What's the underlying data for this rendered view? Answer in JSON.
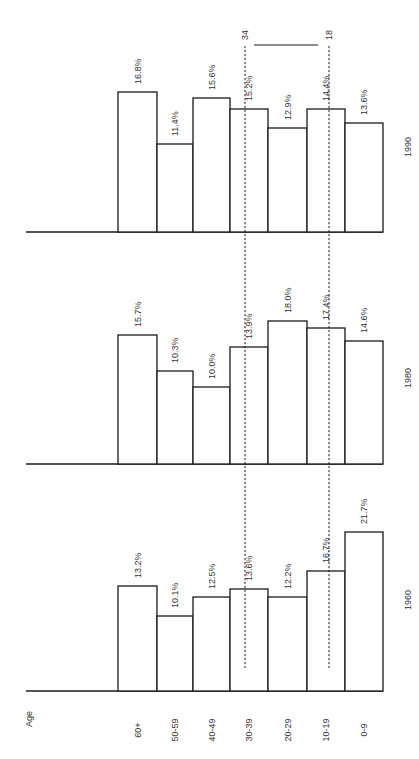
{
  "chart_data": {
    "type": "bar",
    "orientation": "rotated 90deg (text reads bottom-to-top); bars grow upward from horizontal baselines",
    "title": "",
    "xlabel": "Age",
    "ylabel": "",
    "categories": [
      "60+",
      "50-59",
      "40-49",
      "30-39",
      "20-29",
      "10-19",
      "0-9"
    ],
    "series": [
      {
        "name": "1960",
        "values": [
          13.2,
          10.1,
          12.5,
          13.6,
          12.2,
          16.7,
          21.7
        ],
        "labels": [
          "13.2%",
          "10.1%",
          "12.5%",
          "13.6%",
          "12.2%",
          "16.7%",
          "21.7%"
        ]
      },
      {
        "name": "1980",
        "values": [
          15.7,
          10.3,
          10.0,
          13.9,
          18.0,
          17.4,
          14.6
        ],
        "labels": [
          "15.7%",
          "10.3%",
          "10.0%",
          "13.9%",
          "18.0%",
          "17.4%",
          "14.6%"
        ]
      },
      {
        "name": "1990",
        "values": [
          16.8,
          11.4,
          15.6,
          15.2,
          12.9,
          14.4,
          13.6
        ],
        "labels": [
          "16.8%",
          "11.4%",
          "15.6%",
          "15.2%",
          "12.9%",
          "14.4%",
          "13.6%"
        ]
      }
    ],
    "annotations": [
      {
        "type": "dashed-line",
        "at_age": 34,
        "label": "34"
      },
      {
        "type": "dashed-line",
        "at_age": 18,
        "label": "18"
      },
      {
        "type": "bracket",
        "from": "34",
        "to": "18"
      }
    ],
    "grid": false,
    "legend": "none (year labels beside each group)"
  },
  "labels": {
    "axis_title": "Age",
    "marker_34": "34",
    "marker_18": "18"
  },
  "layout": {
    "bar_edges_x": [
      118,
      157,
      193,
      230,
      268,
      307,
      345,
      383
    ],
    "groups": [
      {
        "year": "1990",
        "baseline_y": 232,
        "tops_y": [
          92,
          144,
          98,
          109,
          128,
          109,
          123
        ],
        "year_label_y": 147
      },
      {
        "year": "1980",
        "baseline_y": 464,
        "tops_y": [
          335,
          371,
          387,
          347,
          321,
          328,
          341
        ],
        "year_label_y": 378
      },
      {
        "year": "1960",
        "baseline_y": 691,
        "tops_y": [
          586,
          616,
          597,
          589,
          597,
          571,
          532
        ],
        "year_label_y": 600
      }
    ]
  }
}
